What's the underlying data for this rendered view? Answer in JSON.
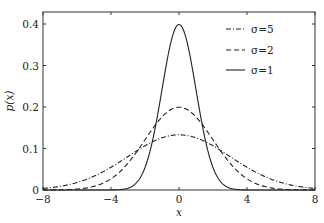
{
  "chart_data": {
    "type": "line",
    "title": "",
    "xlabel": "x",
    "ylabel": "p(x)",
    "xlim": [
      -8,
      8
    ],
    "ylim": [
      0,
      0.43
    ],
    "xticks": [
      -8,
      -4,
      0,
      4,
      8
    ],
    "xtick_labels": [
      "−8",
      "−4",
      "0",
      "4",
      "8"
    ],
    "yticks": [
      0,
      0.1,
      0.2,
      0.3,
      0.4
    ],
    "ytick_labels": [
      "0",
      "0.1",
      "0.2",
      "0.3",
      "0.4"
    ],
    "grid": false,
    "legend_position": "upper right",
    "x": [
      -8,
      -7,
      -6,
      -5,
      -4,
      -3,
      -2,
      -1,
      0,
      1,
      2,
      3,
      4,
      5,
      6,
      7,
      8
    ],
    "series": [
      {
        "name": "σ=5",
        "label": "σ=5",
        "style": "dashdot",
        "peak": 0.133,
        "width_sigma": 3,
        "values": [
          0.004,
          0.009,
          0.018,
          0.033,
          0.054,
          0.081,
          0.107,
          0.126,
          0.133,
          0.126,
          0.107,
          0.081,
          0.054,
          0.033,
          0.018,
          0.009,
          0.004
        ]
      },
      {
        "name": "σ=2",
        "label": "σ=2",
        "style": "dashed",
        "peak": 0.1995,
        "width_sigma": 2,
        "values": [
          0.0001,
          0.0004,
          0.0022,
          0.0088,
          0.027,
          0.065,
          0.121,
          0.176,
          0.1995,
          0.176,
          0.121,
          0.065,
          0.027,
          0.0088,
          0.0022,
          0.0004,
          0.0001
        ]
      },
      {
        "name": "σ=1",
        "label": "σ=1",
        "style": "solid",
        "peak": 0.3989,
        "width_sigma": 1,
        "values": [
          0,
          0,
          0,
          1.5e-06,
          0.0001,
          0.0044,
          0.054,
          0.242,
          0.3989,
          0.242,
          0.054,
          0.0044,
          0.0001,
          1.5e-06,
          0,
          0,
          0
        ]
      }
    ]
  },
  "legend": {
    "items": [
      {
        "label": "σ=5",
        "style": "dashdot"
      },
      {
        "label": "σ=2",
        "style": "dashed"
      },
      {
        "label": "σ=1",
        "style": "solid"
      }
    ]
  },
  "colors": {
    "line": "#222222",
    "axis": "#333333",
    "background": "#ffffff"
  }
}
